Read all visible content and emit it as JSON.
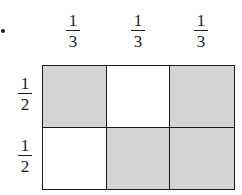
{
  "diagram": {
    "column_labels": [
      {
        "numerator": "1",
        "denominator": "3"
      },
      {
        "numerator": "1",
        "denominator": "3"
      },
      {
        "numerator": "1",
        "denominator": "3"
      }
    ],
    "row_labels": [
      {
        "numerator": "1",
        "denominator": "2"
      },
      {
        "numerator": "1",
        "denominator": "2"
      }
    ],
    "cells": [
      [
        "shaded",
        "blank",
        "shaded"
      ],
      [
        "blank",
        "shaded",
        "shaded"
      ]
    ],
    "colors": {
      "shaded": "#d4d4d4",
      "blank": "#ffffff",
      "line": "#1a1a1a"
    }
  }
}
